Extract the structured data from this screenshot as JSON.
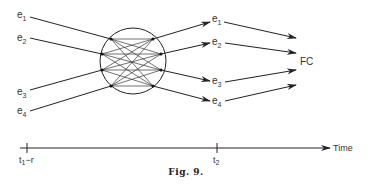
{
  "figure": {
    "caption": "Fig. 9.",
    "inputs": [
      {
        "base": "e",
        "sub": "1"
      },
      {
        "base": "e",
        "sub": "2"
      },
      {
        "base": "e",
        "sub": "3"
      },
      {
        "base": "e",
        "sub": "4"
      }
    ],
    "outputs": [
      {
        "base": "e",
        "sub": "1"
      },
      {
        "base": "e",
        "sub": "2"
      },
      {
        "base": "e",
        "sub": "3"
      },
      {
        "base": "e",
        "sub": "4"
      }
    ],
    "target_label": "FC",
    "time_axis": {
      "label": "Time",
      "ticks": [
        {
          "base": "t",
          "sub": "1",
          "suffix": "−r"
        },
        {
          "base": "t",
          "sub": "2",
          "suffix": ""
        }
      ]
    }
  }
}
